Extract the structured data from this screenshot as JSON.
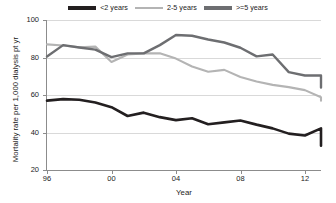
{
  "chart_data": {
    "type": "line",
    "title": "",
    "xlabel": "Year",
    "ylabel": "Mortality rate per 1,000 dialysis pt yr",
    "xlim": [
      1996,
      2013
    ],
    "ylim": [
      20,
      100
    ],
    "y_ticks": [
      20,
      40,
      60,
      80,
      100
    ],
    "x_ticks": [
      1996,
      2000,
      2004,
      2008,
      2012
    ],
    "x_tick_labels": [
      "96",
      "00",
      "04",
      "08",
      "12"
    ],
    "grid": "horizontal",
    "legend_position": "top-center",
    "x": [
      1996,
      1997,
      1998,
      1999,
      2000,
      2001,
      2002,
      2003,
      2004,
      2005,
      2006,
      2007,
      2008,
      2009,
      2010,
      2011,
      2012,
      2013
    ],
    "series": [
      {
        "name": "<2 years",
        "color": "#231f20",
        "values": [
          57,
          57.8,
          57.5,
          56,
          53.5,
          48.8,
          50.6,
          48.2,
          46.6,
          47.6,
          44.4,
          45.4,
          46.4,
          44.2,
          42.2,
          39.4,
          38.4,
          42.2
        ]
      },
      {
        "name": "2-5 years",
        "color": "#b4b4b4",
        "values": [
          87,
          86.4,
          85.5,
          85.8,
          77.6,
          81.6,
          82.2,
          82.2,
          79.4,
          75.2,
          72.4,
          73.4,
          69.6,
          67.2,
          65.4,
          64.2,
          62.6,
          58.8
        ]
      },
      {
        "name": ">=5 years",
        "color": "#6d6e71",
        "values": [
          80.5,
          86.6,
          85.3,
          84.2,
          80.2,
          82.2,
          82.2,
          86.6,
          92,
          91.6,
          89.6,
          88,
          85.2,
          80.6,
          81.6,
          72.2,
          70.4,
          70.4
        ]
      }
    ],
    "series_tail": {
      "note": "final points at 2013",
      "black_end": 33,
      "light_end": 57,
      "dark_end": 64
    }
  },
  "legend": {
    "items": [
      {
        "label": "<2 years",
        "color": "#231f20"
      },
      {
        "label": "2-5 years",
        "color": "#b4b4b4"
      },
      {
        "label": ">=5 years",
        "color": "#6d6e71"
      }
    ]
  },
  "axes": {
    "x_title": "Year",
    "y_title": "Mortality rate per 1,000 dialysis pt yr",
    "y_tick_labels": [
      "100",
      "80",
      "60",
      "40",
      "20"
    ],
    "x_tick_labels": [
      "96",
      "00",
      "04",
      "08",
      "12"
    ]
  },
  "colors": {
    "background": "#ffffff",
    "grid": "#d9d9d9",
    "axis": "#8c8c8c",
    "text": "#1b1b1b"
  }
}
